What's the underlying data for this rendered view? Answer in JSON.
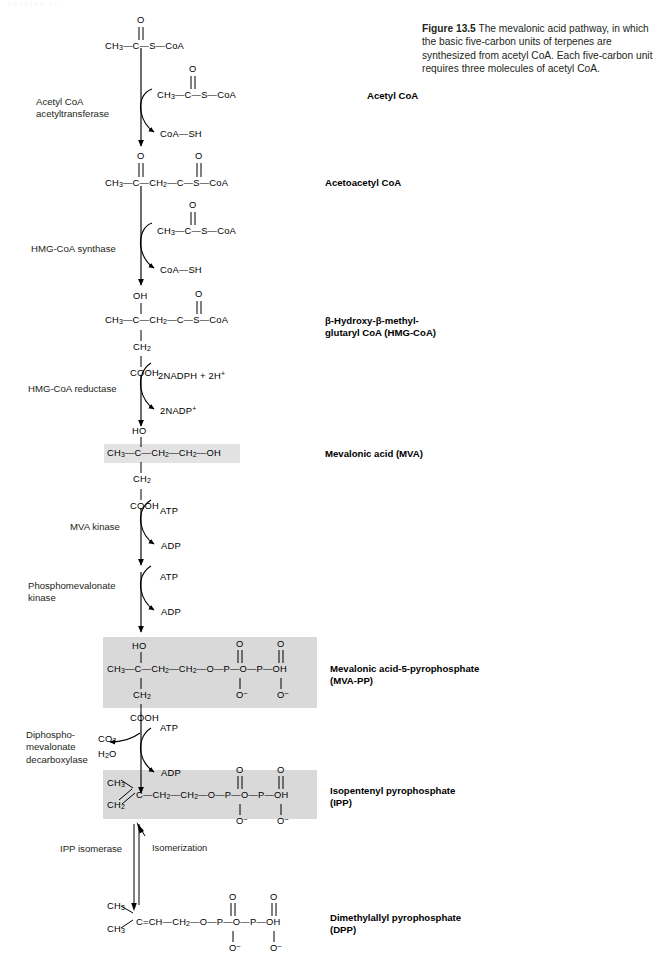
{
  "figure": {
    "number": "Figure 13.5",
    "caption": "The mevalonic acid pathway, in which the basic five-carbon units of terpenes are synthesized from acetyl CoA. Each five-carbon unit requires three molecules of acetyl CoA.",
    "page_header_ghost": "CHAPTER 13"
  },
  "colors": {
    "ink": "#231f20",
    "highlight_strong": "#d9d9d9",
    "highlight_light": "#e2e2e2",
    "background": "#ffffff"
  },
  "enzymes": [
    {
      "id": "acetyl-coa-acetyltransferase",
      "label": "Acetyl CoA\nacetyltransferase"
    },
    {
      "id": "hmg-coa-synthase",
      "label": "HMG-CoA synthase"
    },
    {
      "id": "hmg-coa-reductase",
      "label": "HMG-CoA reductase"
    },
    {
      "id": "mva-kinase",
      "label": "MVA kinase"
    },
    {
      "id": "phosphomevalonate-kinase",
      "label": "Phosphomevalonate\nkinase"
    },
    {
      "id": "diphosphomevalonate-decarboxylase",
      "label": "Diphospho-\nmevalonate\ndecarboxylase"
    },
    {
      "id": "ipp-isomerase",
      "label": "IPP isomerase"
    }
  ],
  "product_labels": [
    {
      "id": "acetyl-coa",
      "label": "Acetyl CoA"
    },
    {
      "id": "acetoacetyl-coa",
      "label": "Acetoacetyl CoA"
    },
    {
      "id": "hmg-coa",
      "label": "β-Hydroxy-β-methyl-\nglutaryl CoA (HMG-CoA)"
    },
    {
      "id": "mevalonic-acid",
      "label": "Mevalonic acid (MVA)"
    },
    {
      "id": "mva-pp",
      "label": "Mevalonic acid-5-pyrophosphate\n(MVA-PP)"
    },
    {
      "id": "ipp",
      "label": "Isopentenyl pyrophosphate\n(IPP)"
    },
    {
      "id": "dpp",
      "label": "Dimethylallyl pyrophosphate\n(DPP)"
    }
  ],
  "cofactors": {
    "coa_sh_1": "CoA—SH",
    "coa_sh_2": "CoA—SH",
    "nadph_in": "2NADPH + 2H",
    "nadph_in_sup": "+",
    "nadp_out": "2NADP",
    "nadp_out_sup": "+",
    "atp_1": "ATP",
    "adp_1": "ADP",
    "atp_2": "ATP",
    "adp_2": "ADP",
    "atp_3": "ATP",
    "adp_3": "ADP",
    "co2": "CO",
    "co2_sub": "2",
    "h2o": "H",
    "h2o_sub": "2",
    "h2o_tail": "O"
  },
  "notes": {
    "isomerization": "Isomerization"
  },
  "molecules": {
    "acetyl_coa_top": {
      "id": "acetyl-coa-top",
      "top_atom": "O",
      "chain": "CH3 — C — S — CoA"
    },
    "acetyl_coa_side": {
      "id": "acetyl-coa-side",
      "top_atom": "O",
      "chain": "CH3 — C — S — CoA"
    },
    "acetoacetyl_coa": {
      "id": "acetoacetyl-coa",
      "top_atoms": [
        "O",
        "O"
      ],
      "chain": "CH3 — C — CH2 — C — S — CoA"
    },
    "acetyl_coa_side2": {
      "id": "acetyl-coa-side-2",
      "top_atom": "O",
      "chain": "CH3 — C — S — CoA"
    },
    "hmg_coa": {
      "id": "hmg-coa-structure",
      "top_left": "OH",
      "top_right": "O",
      "chain": "CH3 — C — CH2 — C — S — CoA",
      "branch": [
        "CH2",
        "COOH"
      ]
    },
    "mevalonic_acid": {
      "id": "mevalonic-acid-structure",
      "top": "HO",
      "chain": "CH3 — C — CH2 — CH2 — OH",
      "branch": [
        "CH2",
        "COOH"
      ],
      "highlighted": true
    },
    "mva_pp": {
      "id": "mva-pp-structure",
      "top": "HO",
      "chain": "CH3 — C — CH2 — CH2 — O — P — O — P — OH",
      "phosphate_top": [
        "O",
        "O"
      ],
      "phosphate_bottom": [
        "O⁻",
        "O⁻"
      ],
      "branch": [
        "CH2",
        "COOH"
      ],
      "highlighted": true
    },
    "ipp": {
      "id": "ipp-structure",
      "branch_top": "CH3",
      "branch_bottom": "CH2",
      "chain": "C — CH2 — CH2 — O — P — O — P — OH",
      "phosphate_top": [
        "O",
        "O"
      ],
      "phosphate_bottom": [
        "O⁻",
        "O⁻"
      ],
      "highlighted": true
    },
    "dpp": {
      "id": "dpp-structure",
      "branch_top": "CH3",
      "branch_bottom": "CH3",
      "chain": "C = CH — CH2 — O — P — O — P — OH",
      "phosphate_top": [
        "O",
        "O"
      ],
      "phosphate_bottom": [
        "O⁻",
        "O⁻"
      ],
      "highlighted": false
    }
  },
  "atoms": {
    "O": "O",
    "OH": "OH",
    "HO": "HO",
    "S": "S",
    "P": "P",
    "C": "C",
    "CoA": "CoA",
    "COOH": "COOH",
    "SH": "SH",
    "CH3": "CH",
    "CH3_sub": "3",
    "CH2": "CH",
    "CH2_sub": "2",
    "Ominus": "O",
    "Ominus_sup": "–",
    "dash": "—",
    "eq": "="
  }
}
